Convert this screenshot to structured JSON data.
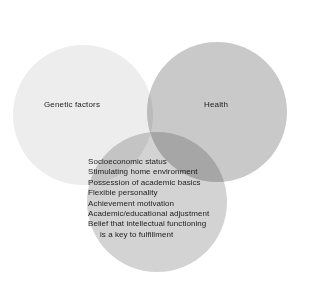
{
  "figure": {
    "type": "venn-diagram",
    "width": 310,
    "height": 286,
    "background_color": "#ffffff",
    "text_color": "#1c1c1c"
  },
  "circles": [
    {
      "key": "genetic-factors",
      "label": "Genetic factors",
      "color": "#ededed",
      "cx": 83,
      "cy": 115,
      "r": 70
    },
    {
      "key": "health",
      "label": "Health",
      "color": "#c9c9c9",
      "cx": 217,
      "cy": 112,
      "r": 70
    },
    {
      "key": "environment-factors",
      "label": "",
      "color": "#d3d3d3",
      "cx": 157,
      "cy": 202,
      "r": 70
    }
  ],
  "attributes": {
    "items": [
      {
        "text": "Socioeconomic status",
        "continuation": false
      },
      {
        "text": "Stimulating home environment",
        "continuation": false
      },
      {
        "text": "Possession of academic basics",
        "continuation": false
      },
      {
        "text": "Flexible personality",
        "continuation": false
      },
      {
        "text": "Achievement motivation",
        "continuation": false
      },
      {
        "text": "Academic/educational adjustment",
        "continuation": false
      },
      {
        "text": "Belief that intellectual functioning",
        "continuation": false
      },
      {
        "text": "is a key to fulfillment",
        "continuation": true
      }
    ]
  }
}
